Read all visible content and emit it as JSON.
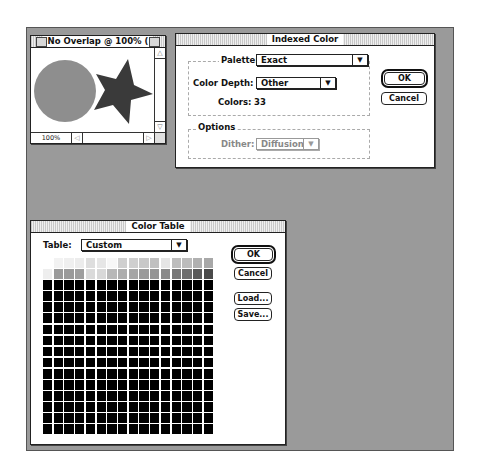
{
  "document_window": {
    "title": "No Overlap @ 100% (",
    "zoom_level": "100%",
    "shapes": {
      "circle_color": "#8e8e8e",
      "star_color": "#3a3a3a"
    }
  },
  "indexed_color_dialog": {
    "title": "Indexed Color",
    "palette_label": "Palette:",
    "palette_value": "Exact",
    "color_depth_label": "Color Depth:",
    "color_depth_value": "Other",
    "colors_label": "Colors:",
    "colors_value": "33",
    "options_label": "Options",
    "dither_label": "Dither:",
    "dither_value": "Diffusion",
    "ok_label": "OK",
    "cancel_label": "Cancel"
  },
  "color_table_dialog": {
    "title": "Color Table",
    "table_label": "Table:",
    "table_value": "Custom",
    "ok_label": "OK",
    "cancel_label": "Cancel",
    "load_label": "Load...",
    "save_label": "Save...",
    "grid": {
      "columns": 16,
      "rows": 16,
      "row1_colors": [
        "#ffffff",
        "#f2f2f2",
        "#efefef",
        "#ececec",
        "#dedede",
        "#e6e6e6",
        "#f7f7f7",
        "#cfcfcf",
        "#cfcfcf",
        "#c8c8c8",
        "#c0c0c0",
        "#e5e5e5",
        "#bdbdbd",
        "#bcbcbc",
        "#b0b0b0",
        "#a8a8a8"
      ],
      "row2_colors": [
        "#eeeeee",
        "#9a9a9a",
        "#9a9a9a",
        "#9e9e9e",
        "#dadada",
        "#d8d8d8",
        "#b8b8b8",
        "#adadad",
        "#a5a5a5",
        "#9a9a9a",
        "#959595",
        "#8a8a8a",
        "#777777",
        "#6e6e6e",
        "#5a5a5a",
        "#4a4a4a"
      ],
      "remaining_color": "#000000"
    }
  }
}
